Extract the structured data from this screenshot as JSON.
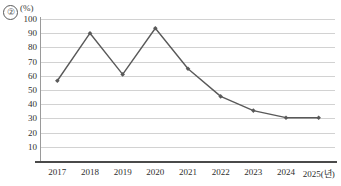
{
  "item_number": "②",
  "unit_label": "(%)",
  "chart_data": {
    "type": "line",
    "title": "",
    "subtitle": "",
    "xlabel": "",
    "ylabel": "(%)",
    "categories": [
      "2017",
      "2018",
      "2019",
      "2020",
      "2021",
      "2022",
      "2023",
      "2024",
      "2025"
    ],
    "x_tick_labels": [
      "2017",
      "2018",
      "2019",
      "2020",
      "2021",
      "2022",
      "2023",
      "2024",
      "2025(년)"
    ],
    "x_axis_unit_note": "(년)",
    "values": [
      56.5,
      90.0,
      61.0,
      93.5,
      65.0,
      45.5,
      35.5,
      30.5,
      30.5
    ],
    "series": [
      {
        "name": "",
        "values": [
          56.5,
          90.0,
          61.0,
          93.5,
          65.0,
          45.5,
          35.5,
          30.5,
          30.5
        ]
      }
    ],
    "ylim": [
      0,
      100
    ],
    "y_tick_labels": [
      "100",
      "90",
      "80",
      "70",
      "60",
      "50",
      "40",
      "30",
      "20",
      "10"
    ],
    "y_tick_values": [
      100,
      90,
      80,
      70,
      60,
      50,
      40,
      30,
      20,
      10
    ],
    "grid": true,
    "grid_axis": "y",
    "legend": false,
    "legend_position": "none",
    "marker": "diamond",
    "line_color": "#595959",
    "marker_color": "#595959",
    "grid_color": "#d2d2d2",
    "axis_color": "#4a4a4a",
    "background_color": "#ffffff"
  }
}
